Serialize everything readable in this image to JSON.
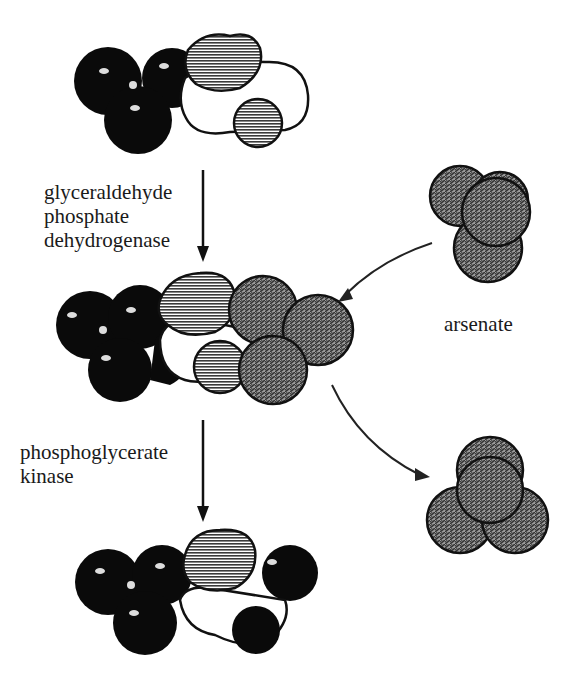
{
  "diagram": {
    "steps": [
      {
        "enzyme_lines": [
          "glyceraldehyde",
          "phosphate",
          "dehydrogenase"
        ]
      },
      {
        "enzyme_lines": [
          "phosphoglycerate",
          "kinase"
        ]
      }
    ],
    "side_label": "arsenate",
    "molecules": [
      {
        "id": "substrate-top",
        "description": "glyceraldehyde 3-phosphate space-filling model"
      },
      {
        "id": "intermediate-middle",
        "description": "1-arseno-3-phosphoglycerate model with bound arsenate"
      },
      {
        "id": "product-bottom",
        "description": "3-phosphoglycerate model"
      },
      {
        "id": "arsenate-in",
        "description": "arsenate molecule entering"
      },
      {
        "id": "arsenate-out",
        "description": "arsenate molecule released"
      }
    ],
    "colors": {
      "black_atoms": "#0a0a0a",
      "hatched_atoms": "#777777",
      "white_atoms": "#ffffff",
      "arsenate": "#6e6e6e",
      "line": "#1a1a1a"
    }
  }
}
